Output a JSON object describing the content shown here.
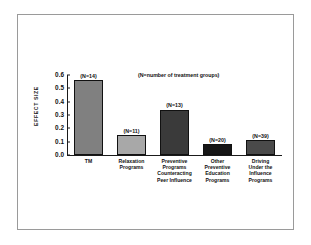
{
  "chart_data": {
    "type": "bar",
    "title": "",
    "subtitle": "",
    "xlabel": "",
    "ylabel": "EFFECT SIZE",
    "ylim": [
      0.0,
      0.6
    ],
    "yticks": [
      "0.0",
      "0.1",
      "0.2",
      "0.3",
      "0.4",
      "0.5",
      "0.6"
    ],
    "ytick_values": [
      0.0,
      0.1,
      0.2,
      0.3,
      0.4,
      0.5,
      0.6
    ],
    "grid": false,
    "legend": "none",
    "annotation": "(N=number of treatment groups)",
    "categories": [
      "TM",
      "Relaxation Programs",
      "Preventive Programs Counteracting Peer Influence",
      "Other Preventive Education Programs",
      "Driving Under the Influence Programs"
    ],
    "category_lines": [
      [
        "TM"
      ],
      [
        "Relaxation",
        "Programs"
      ],
      [
        "Preventive",
        "Programs",
        "Counteracting",
        "Peer Influence"
      ],
      [
        "Other",
        "Preventive",
        "Education",
        "Programs"
      ],
      [
        "Driving",
        "Under the",
        "Influence",
        "Programs"
      ]
    ],
    "values": [
      0.56,
      0.15,
      0.34,
      0.08,
      0.11
    ],
    "point_labels": [
      "(N=14)",
      "(N=11)",
      "(N=13)",
      "(N=20)",
      "(N=39)"
    ],
    "n_values": [
      14,
      11,
      13,
      20,
      39
    ],
    "bar_colors": [
      "#808080",
      "#a8a8a8",
      "#3a3a3a",
      "#161616",
      "#4a4a4a"
    ]
  },
  "figure": {
    "background_color": "#ffffff",
    "border_color": "#9a9a9a",
    "axis_color": "#1a1a1a"
  }
}
